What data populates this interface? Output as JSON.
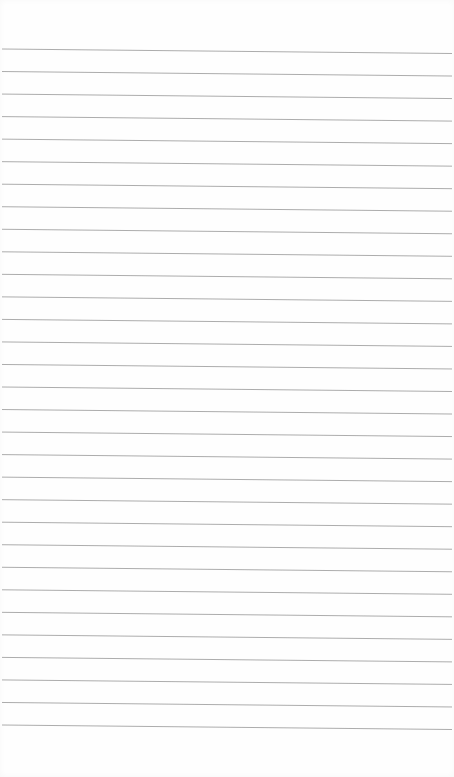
{
  "page": {
    "type": "ruled-notebook-paper",
    "ruled_line_count": 31,
    "colors": {
      "paper": "#fefefe",
      "rule": "#a3a3a3"
    }
  }
}
